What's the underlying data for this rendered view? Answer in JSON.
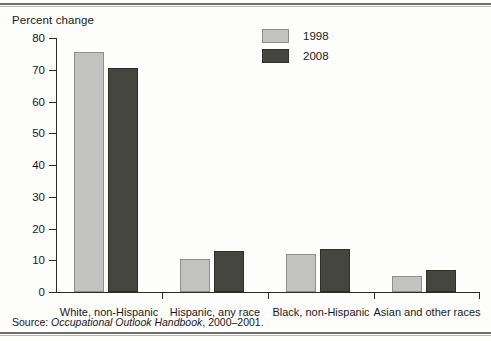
{
  "figure": {
    "axis_title": "Percent change",
    "source_prefix": "Source: ",
    "source_italic": "Occupational Outlook Handbook",
    "source_suffix": ", 2000–2001."
  },
  "legend": {
    "position": "top-center",
    "items": [
      {
        "label": "1998",
        "color": "#c2c2c0",
        "swatch": "light"
      },
      {
        "label": "2008",
        "color": "#464640",
        "swatch": "dark"
      }
    ]
  },
  "chart_data": {
    "type": "bar",
    "title": "Percent change",
    "xlabel": "",
    "ylabel": "Percent change",
    "ylim": [
      0,
      80
    ],
    "yticks": [
      0,
      10,
      20,
      30,
      40,
      50,
      60,
      70,
      80
    ],
    "ytick_labels": [
      "0",
      "10",
      "20",
      "30",
      "40",
      "50",
      "60",
      "70",
      "80"
    ],
    "grid": false,
    "legend_position": "top-center",
    "categories": [
      "White, non-Hispanic",
      "Hispanic, any race",
      "Black, non-Hispanic",
      "Asian and other races"
    ],
    "series": [
      {
        "name": "1998",
        "color": "#c2c2c0",
        "values": [
          75.5,
          10.5,
          12.0,
          5.0
        ]
      },
      {
        "name": "2008",
        "color": "#464640",
        "values": [
          70.5,
          13.0,
          13.5,
          7.0
        ]
      }
    ]
  }
}
